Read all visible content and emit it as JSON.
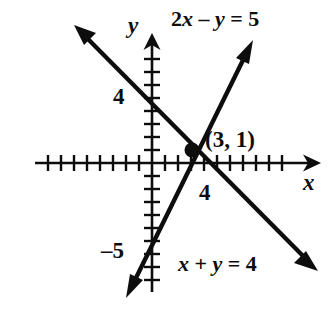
{
  "figure": {
    "kind": "coordinate-plane-graph",
    "background_color": "#ffffff",
    "ink_color": "#0d0d0d",
    "width": 335,
    "height": 320
  },
  "axes": {
    "x_axis_label": "x",
    "y_axis_label": "y",
    "origin_px": {
      "x": 152,
      "y": 163
    },
    "unit_px": 13,
    "x_tick_labels": [
      {
        "text": "4",
        "value": 4
      }
    ],
    "y_tick_labels": [
      {
        "text": "4",
        "value": 4
      },
      {
        "text": "–5",
        "value": -5
      }
    ],
    "x_ticks_left_of_origin": 8,
    "x_ticks_right_of_origin": 8,
    "y_ticks_above_origin": 8,
    "y_ticks_below_origin": 9,
    "arrowheads": [
      "x-positive",
      "y-positive",
      "y-negative"
    ]
  },
  "chart_data": {
    "type": "line",
    "title": "",
    "xlabel": "x",
    "ylabel": "y",
    "grid": false,
    "xlim": [
      -8,
      9
    ],
    "ylim": [
      -10,
      9
    ],
    "series": [
      {
        "name": "2x – y = 5",
        "equation_text": "2x – y = 5",
        "slope": 2,
        "intercept": -5,
        "endpoints": [
          {
            "x": -1.8,
            "y": -8.6
          },
          {
            "x": 7.5,
            "y": 10
          }
        ],
        "label_position": "upper-right"
      },
      {
        "name": "x + y = 4",
        "equation_text": "x + y = 4",
        "slope": -1,
        "intercept": 4,
        "endpoints": [
          {
            "x": -5.7,
            "y": 9.7
          },
          {
            "x": 12.6,
            "y": -8.6
          }
        ],
        "label_position": "lower-right"
      }
    ],
    "annotations": [
      {
        "text": "(3, 1)",
        "point": {
          "x": 3,
          "y": 1
        },
        "marker": "filled-dot",
        "note": "solution / intersection point"
      }
    ]
  },
  "labels": {
    "equation_line_1": "2x – y = 5",
    "equation_line_2": "x + y = 4",
    "intersection": "(3, 1)",
    "y_tick_4": "4",
    "y_tick_minus5": "–5",
    "x_tick_4": "4",
    "axis_x": "x",
    "axis_y": "y"
  }
}
